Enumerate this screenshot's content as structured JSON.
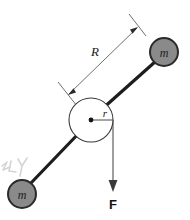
{
  "figure": {
    "background_color": "#ffffff",
    "labels": {
      "radius_big": "R",
      "radius_small": "r",
      "mass_top_right": "m",
      "mass_bottom_left": "m",
      "force": "F",
      "margin_scribble": "2LY"
    },
    "colors": {
      "rod": "#1d1d1d",
      "mass_fill": "#8a8a8a",
      "mass_stroke": "#2a2a2a",
      "hub_stroke": "#3a3a3a",
      "hub_fill": "#ffffff",
      "dimension_line": "#6f6f6f",
      "force_arrow": "#5f5f5f",
      "text": "#1a1a1a",
      "scribble": "#d2d2d2"
    },
    "geometry": {
      "hub_center_x": 91,
      "hub_center_y": 120,
      "hub_radius": 22,
      "mass_top_right_x": 164,
      "mass_top_right_y": 52,
      "mass_bottom_left_x": 22,
      "mass_bottom_left_y": 194,
      "mass_radius": 14,
      "force_arrow_x": 113,
      "force_arrow_top_y": 120,
      "force_arrow_tip_y": 191
    }
  }
}
